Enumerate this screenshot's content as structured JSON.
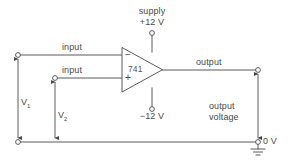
{
  "diagram": {
    "component": {
      "part_number": "741",
      "inverting_marker": "−",
      "noninverting_marker": "+"
    },
    "supply": {
      "label": "supply",
      "positive": "+12 V",
      "negative": "−12 V"
    },
    "inputs": [
      {
        "label": "input",
        "voltage_symbol": "V",
        "voltage_subscript": "1"
      },
      {
        "label": "input",
        "voltage_symbol": "V",
        "voltage_subscript": "2"
      }
    ],
    "output": {
      "label": "output",
      "quantity_line1": "output",
      "quantity_line2": "voltage"
    },
    "ground": {
      "label": "0 V",
      "icon": "ground-icon"
    },
    "colors": {
      "wire": "#5a5a5a",
      "text": "#4a4a4a",
      "background": "#ffffff"
    }
  }
}
